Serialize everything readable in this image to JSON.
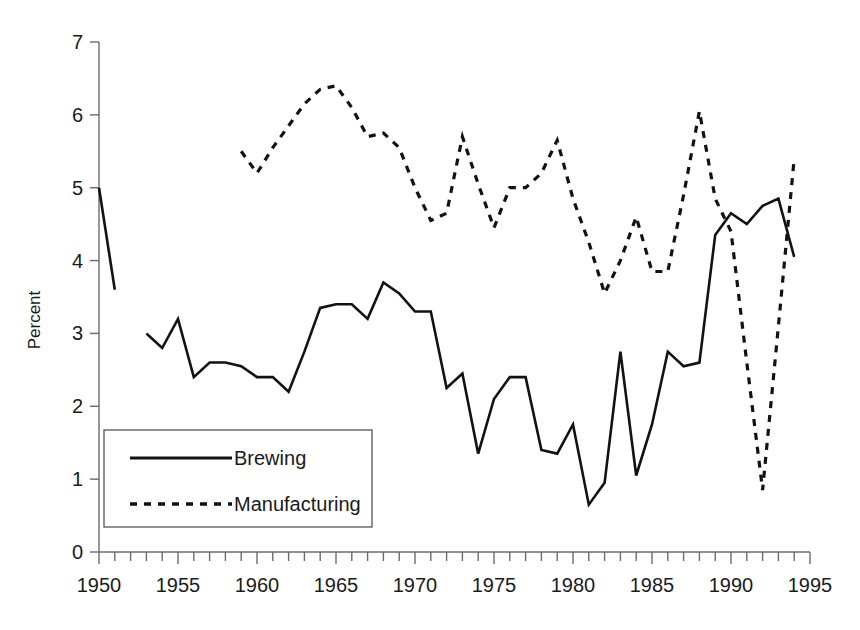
{
  "chart_data": {
    "type": "line",
    "title": "",
    "subtitle": "",
    "xlabel": "",
    "ylabel": "Percent",
    "xlim": [
      1950,
      1995
    ],
    "ylim": [
      0,
      7
    ],
    "grid": false,
    "legend_position": "lower-left-inside",
    "x_tick_labels": [
      "1950",
      "1955",
      "1960",
      "1965",
      "1970",
      "1975",
      "1980",
      "1985",
      "1990",
      "1995"
    ],
    "x_tick_values": [
      1950,
      1955,
      1960,
      1965,
      1970,
      1975,
      1980,
      1985,
      1990,
      1995
    ],
    "x_minor_tick_interval": 1,
    "y_tick_labels": [
      "0",
      "1",
      "2",
      "3",
      "4",
      "5",
      "6",
      "7"
    ],
    "y_tick_values": [
      0,
      1,
      2,
      3,
      4,
      5,
      6,
      7
    ],
    "series": [
      {
        "name": "Brewing",
        "style": "solid",
        "color": "#121212",
        "segments": [
          {
            "x": [
              1950,
              1951
            ],
            "values": [
              5.0,
              3.6
            ]
          },
          {
            "x": [
              1953,
              1954,
              1955,
              1956,
              1957,
              1958,
              1959,
              1960,
              1961,
              1962,
              1963,
              1964,
              1965,
              1966,
              1967,
              1968,
              1969,
              1970,
              1971,
              1972,
              1973,
              1974,
              1975,
              1976,
              1977,
              1978,
              1979,
              1980,
              1981,
              1982,
              1983,
              1984,
              1985,
              1986,
              1987,
              1988,
              1989,
              1990,
              1991,
              1992,
              1993,
              1994
            ],
            "values": [
              3.0,
              2.8,
              3.2,
              2.4,
              2.6,
              2.6,
              2.55,
              2.4,
              2.4,
              2.2,
              2.75,
              3.35,
              3.4,
              3.4,
              3.2,
              3.7,
              3.55,
              3.3,
              3.3,
              2.25,
              2.45,
              1.35,
              2.1,
              2.4,
              2.4,
              1.4,
              1.35,
              1.75,
              0.65,
              0.95,
              2.75,
              1.05,
              1.75,
              2.75,
              2.55,
              2.6,
              4.35,
              4.65,
              4.5,
              4.75,
              4.85,
              4.05
            ]
          }
        ]
      },
      {
        "name": "Manufacturing",
        "style": "dashed",
        "color": "#121212",
        "segments": [
          {
            "x": [
              1959,
              1960,
              1961,
              1962,
              1963,
              1964,
              1965,
              1966,
              1967,
              1968,
              1969,
              1970,
              1971,
              1972,
              1973,
              1974,
              1975,
              1976,
              1977,
              1978,
              1979,
              1980,
              1981,
              1982,
              1983,
              1984,
              1985,
              1986,
              1987,
              1988,
              1989,
              1990,
              1991,
              1992,
              1993,
              1994
            ],
            "values": [
              5.5,
              5.2,
              5.55,
              5.85,
              6.15,
              6.35,
              6.4,
              6.1,
              5.7,
              5.75,
              5.55,
              5.0,
              4.55,
              4.65,
              5.7,
              5.05,
              4.45,
              5.0,
              5.0,
              5.2,
              5.65,
              4.85,
              4.25,
              3.55,
              4.0,
              4.6,
              3.85,
              3.85,
              4.9,
              6.05,
              4.85,
              4.4,
              2.6,
              0.85,
              3.1,
              5.4
            ]
          }
        ]
      }
    ]
  },
  "legend": {
    "items": [
      {
        "label": "Brewing",
        "style": "solid"
      },
      {
        "label": "Manufacturing",
        "style": "dashed"
      }
    ]
  },
  "axes": {
    "y_title": "Percent"
  }
}
